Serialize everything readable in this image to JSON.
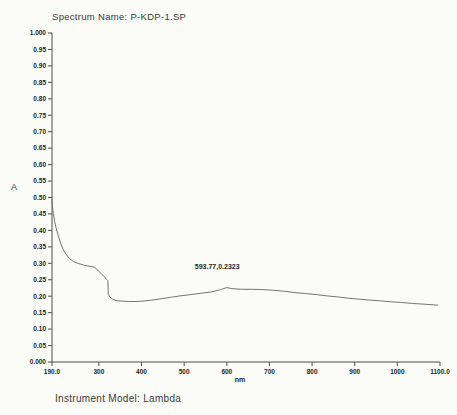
{
  "header": {
    "title": "Spectrum Name: P-KDP-1.SP"
  },
  "footer": {
    "instrument_model": "Instrument Model: Lambda"
  },
  "colors": {
    "background": "#fbfbf7",
    "text": "#3a3a3a",
    "axis": "#4f4f4f",
    "curve": "#757575",
    "tick_text": "#1f1f1f"
  },
  "chart_data": {
    "type": "line",
    "title": "Spectrum Name: P-KDP-1.SP",
    "xlabel": "nm",
    "ylabel": "A",
    "xlim": [
      190,
      1100
    ],
    "ylim": [
      0,
      1.0
    ],
    "grid": false,
    "legend": null,
    "x_ticks": [
      {
        "value": 190,
        "label": "190.0"
      },
      {
        "value": 300,
        "label": "300"
      },
      {
        "value": 400,
        "label": "400"
      },
      {
        "value": 500,
        "label": "500"
      },
      {
        "value": 600,
        "label": "600"
      },
      {
        "value": 700,
        "label": "700"
      },
      {
        "value": 800,
        "label": "800"
      },
      {
        "value": 900,
        "label": "900"
      },
      {
        "value": 1000,
        "label": "1000"
      },
      {
        "value": 1100,
        "label": "1100.0"
      }
    ],
    "y_ticks": [
      {
        "value": 1.0,
        "label": "1.000"
      },
      {
        "value": 0.95,
        "label": "0.95"
      },
      {
        "value": 0.9,
        "label": "0.90"
      },
      {
        "value": 0.85,
        "label": "0.85"
      },
      {
        "value": 0.8,
        "label": "0.80"
      },
      {
        "value": 0.75,
        "label": "0.75"
      },
      {
        "value": 0.7,
        "label": "0.70"
      },
      {
        "value": 0.65,
        "label": "0.65"
      },
      {
        "value": 0.6,
        "label": "0.60"
      },
      {
        "value": 0.55,
        "label": "0.55"
      },
      {
        "value": 0.5,
        "label": "0.50"
      },
      {
        "value": 0.45,
        "label": "0.45"
      },
      {
        "value": 0.4,
        "label": "0.40"
      },
      {
        "value": 0.35,
        "label": "0.35"
      },
      {
        "value": 0.3,
        "label": "0.30"
      },
      {
        "value": 0.25,
        "label": "0.25"
      },
      {
        "value": 0.2,
        "label": "0.20"
      },
      {
        "value": 0.15,
        "label": "0.15"
      },
      {
        "value": 0.1,
        "label": "0.10"
      },
      {
        "value": 0.05,
        "label": "0.05"
      },
      {
        "value": 0.0,
        "label": "0.000"
      }
    ],
    "annotation": {
      "text": "593.77,0.2323",
      "x": 525,
      "y": 0.29
    },
    "series": [
      {
        "name": "P-KDP-1.SP",
        "points": [
          [
            190,
            0.494
          ],
          [
            191,
            0.475
          ],
          [
            193,
            0.452
          ],
          [
            196,
            0.428
          ],
          [
            200,
            0.405
          ],
          [
            205,
            0.383
          ],
          [
            210,
            0.362
          ],
          [
            216,
            0.343
          ],
          [
            223,
            0.327
          ],
          [
            231,
            0.314
          ],
          [
            241,
            0.305
          ],
          [
            253,
            0.299
          ],
          [
            266,
            0.294
          ],
          [
            279,
            0.291
          ],
          [
            290,
            0.288
          ],
          [
            298,
            0.278
          ],
          [
            306,
            0.268
          ],
          [
            313,
            0.259
          ],
          [
            318,
            0.251
          ],
          [
            321,
            0.247
          ],
          [
            322,
            0.205
          ],
          [
            326,
            0.197
          ],
          [
            332,
            0.191
          ],
          [
            340,
            0.187
          ],
          [
            355,
            0.185
          ],
          [
            372,
            0.184
          ],
          [
            390,
            0.184
          ],
          [
            410,
            0.186
          ],
          [
            430,
            0.189
          ],
          [
            450,
            0.193
          ],
          [
            470,
            0.197
          ],
          [
            490,
            0.201
          ],
          [
            515,
            0.205
          ],
          [
            540,
            0.209
          ],
          [
            565,
            0.213
          ],
          [
            585,
            0.22
          ],
          [
            600,
            0.226
          ],
          [
            612,
            0.223
          ],
          [
            635,
            0.221
          ],
          [
            660,
            0.221
          ],
          [
            685,
            0.22
          ],
          [
            710,
            0.218
          ],
          [
            735,
            0.215
          ],
          [
            760,
            0.211
          ],
          [
            785,
            0.208
          ],
          [
            810,
            0.205
          ],
          [
            835,
            0.201
          ],
          [
            860,
            0.198
          ],
          [
            885,
            0.194
          ],
          [
            910,
            0.191
          ],
          [
            935,
            0.188
          ],
          [
            960,
            0.186
          ],
          [
            985,
            0.183
          ],
          [
            1010,
            0.181
          ],
          [
            1035,
            0.178
          ],
          [
            1060,
            0.176
          ],
          [
            1085,
            0.174
          ],
          [
            1095,
            0.173
          ]
        ]
      }
    ]
  }
}
